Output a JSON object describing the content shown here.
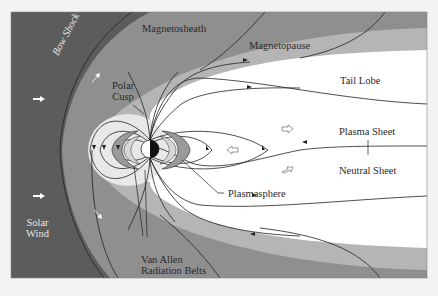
{
  "diagram": {
    "colors": {
      "solar_wind": "#5c5c5c",
      "magnetosheath": "#8f8f8f",
      "magnetopause_layer": "#b5b5b5",
      "magnetosphere": "#ffffff",
      "plasmasphere_inner": "#e6e6e6",
      "belts": "#9a9a9a",
      "field_line": "#222222",
      "page_background": "#f3f3f3"
    },
    "labels": {
      "magnetosheath": "Magnetosheath",
      "magnetopause": "Magnetopause",
      "tail_lobe": "Tail Lobe",
      "plasma_sheet": "Plasma Sheet",
      "neutral_sheet": "Neutral Sheet",
      "plasmasphere": "Plasmasphere",
      "polar_cusp_line1": "Polar",
      "polar_cusp_line2": "Cusp",
      "bow_shock": "Bow Shock",
      "solar_wind_line1": "Solar",
      "solar_wind_line2": "Wind",
      "van_allen_line1": "Van Allen",
      "van_allen_line2": "Radiation Belts"
    },
    "regions": [
      "Solar Wind",
      "Bow Shock",
      "Magnetosheath",
      "Magnetopause",
      "Polar Cusp",
      "Tail Lobe",
      "Plasma Sheet",
      "Neutral Sheet",
      "Plasmasphere",
      "Van Allen Radiation Belts"
    ]
  }
}
